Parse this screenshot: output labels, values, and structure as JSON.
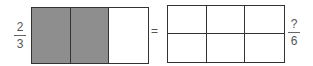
{
  "left": {
    "numerator": "2",
    "denominator": "3",
    "columns": 3,
    "shaded": [
      true,
      true,
      false
    ]
  },
  "equals": "=",
  "right": {
    "numerator": "?",
    "denominator": "6",
    "rows": 2,
    "columns": 3
  },
  "colors": {
    "shaded": "#8e8e8e",
    "border": "#333333"
  }
}
